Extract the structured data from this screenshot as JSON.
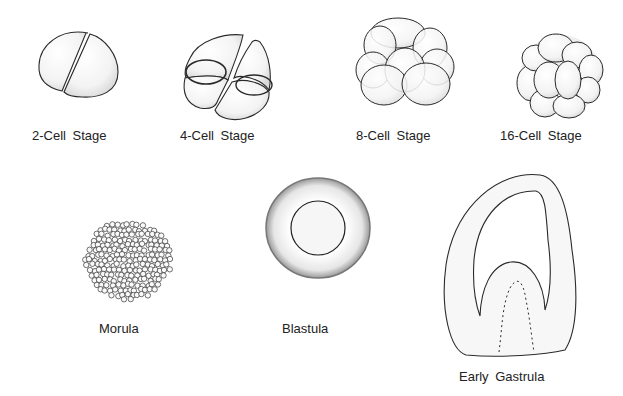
{
  "stages": [
    {
      "id": "2-cell",
      "label": "2-Cell  Stage"
    },
    {
      "id": "4-cell",
      "label": "4-Cell  Stage"
    },
    {
      "id": "8-cell",
      "label": "8-Cell  Stage"
    },
    {
      "id": "16-cell",
      "label": "16-Cell  Stage"
    },
    {
      "id": "morula",
      "label": "Morula"
    },
    {
      "id": "blastula",
      "label": "Blastula"
    },
    {
      "id": "early-gastrula",
      "label": "Early  Gastrula"
    }
  ],
  "colors": {
    "stroke": "#2a2a2a",
    "fill": "#f4f4f4",
    "shade": "#d8d8d8"
  }
}
